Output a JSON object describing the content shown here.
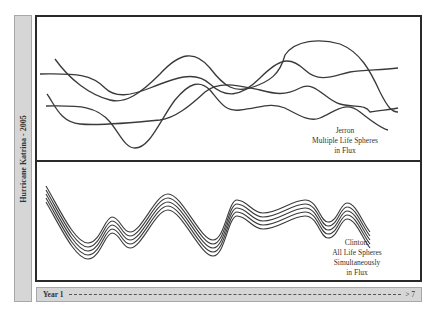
{
  "side_label": "Hurricane Katrina - 2005",
  "top_panel": {
    "caption_lines": [
      "Jerron",
      "Multiple Life Spheres",
      "in Flux"
    ],
    "description": "Four independent wavy lines crossing each other at different times"
  },
  "bottom_panel": {
    "caption_lines": [
      "Clinton:",
      "All Life Spheres",
      "Simultaneously",
      "in Flux"
    ],
    "description": "Five parallel wavy lines moving together in sync"
  },
  "timeline": {
    "start_label": "Year 1",
    "end_label": "> 7"
  },
  "colors": {
    "line": "#3a3a3a",
    "bar_fill": "#d6d6d6",
    "frame": "#2a2a2a"
  }
}
